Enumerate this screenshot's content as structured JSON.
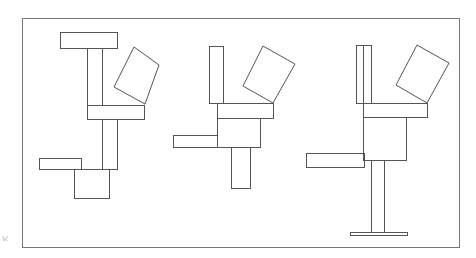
{
  "diagram": {
    "type": "line-drawing",
    "stroke_color": "#555555",
    "frame_color": "#777777",
    "background": "#ffffff",
    "corner_mark": "V.",
    "frame": {
      "x": 22,
      "y": 18,
      "w": 437,
      "h": 229
    },
    "figures": [
      {
        "name": "figure-1",
        "rects": [
          {
            "role": "top-bar",
            "x": 60,
            "y": 32,
            "w": 57,
            "h": 16
          },
          {
            "role": "upper-vertical",
            "x": 87,
            "y": 48,
            "w": 15,
            "h": 57
          },
          {
            "role": "middle-bar",
            "x": 87,
            "y": 105,
            "w": 57,
            "h": 14
          },
          {
            "role": "lower-vertical",
            "x": 102,
            "y": 119,
            "w": 15,
            "h": 50
          },
          {
            "role": "left-bar",
            "x": 39,
            "y": 158,
            "w": 42,
            "h": 11
          },
          {
            "role": "bottom-box",
            "x": 74,
            "y": 169,
            "w": 35,
            "h": 29
          }
        ],
        "tilted_square": "134,47 159,65 145,104 114,87"
      },
      {
        "name": "figure-2",
        "rects": [
          {
            "role": "tall-vertical",
            "x": 209,
            "y": 46,
            "w": 14,
            "h": 57
          },
          {
            "role": "horizontal-bar",
            "x": 217,
            "y": 103,
            "w": 56,
            "h": 15
          },
          {
            "role": "box",
            "x": 217,
            "y": 118,
            "w": 43,
            "h": 29
          },
          {
            "role": "left-bar",
            "x": 173,
            "y": 135,
            "w": 44,
            "h": 12
          },
          {
            "role": "lower-vertical",
            "x": 231,
            "y": 147,
            "w": 19,
            "h": 41
          }
        ],
        "tilted_square": "263,46 295,64 273,103 243,86"
      },
      {
        "name": "figure-3",
        "rects": [
          {
            "role": "double-vertical",
            "x": 356,
            "y": 45,
            "w": 15,
            "h": 58
          },
          {
            "role": "horizontal-bar",
            "x": 363,
            "y": 103,
            "w": 64,
            "h": 14
          },
          {
            "role": "box",
            "x": 363,
            "y": 117,
            "w": 43,
            "h": 43
          },
          {
            "role": "left-bar",
            "x": 306,
            "y": 153,
            "w": 58,
            "h": 14
          },
          {
            "role": "stem",
            "x": 371,
            "y": 160,
            "w": 13,
            "h": 72
          },
          {
            "role": "foot",
            "x": 350,
            "y": 232,
            "w": 57,
            "h": 3
          }
        ],
        "inner_line_x": 363,
        "tilted_square": "417,45 449,63 427,103 396,85"
      }
    ]
  }
}
